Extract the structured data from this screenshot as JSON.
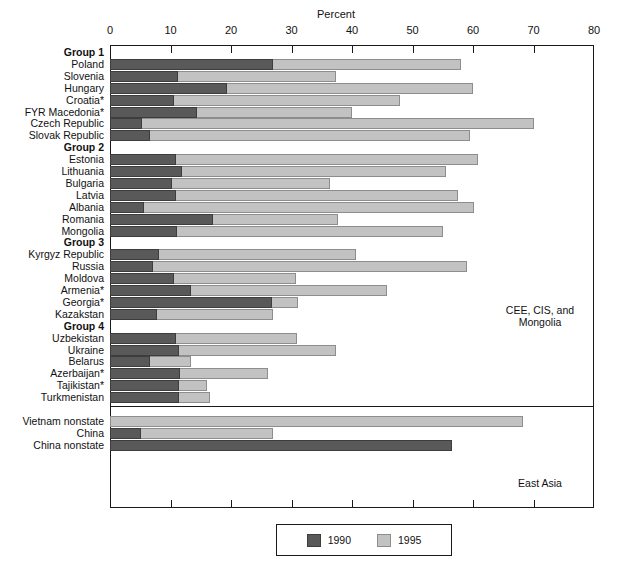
{
  "chart_data": {
    "type": "bar",
    "orientation": "horizontal",
    "stacked": false,
    "title": "",
    "xlabel": "Percent",
    "ylabel": "",
    "xlim": [
      0,
      80
    ],
    "xticks": [
      0,
      10,
      20,
      30,
      40,
      50,
      60,
      70,
      80
    ],
    "grid": false,
    "legend_position": "bottom",
    "series": [
      {
        "name": "1990",
        "color": "#595959"
      },
      {
        "name": "1995",
        "color": "#c2c2c2"
      }
    ],
    "annotations": [
      {
        "text": "CEE, CIS, and Mongolia",
        "region": "upper-right-inside-plot"
      },
      {
        "text": "East Asia",
        "region": "lower-right-inside-plot"
      }
    ],
    "rows": [
      {
        "label": "Group 1",
        "kind": "group",
        "v1990": null,
        "v1995": null
      },
      {
        "label": "Poland",
        "kind": "country",
        "v1990": 27.0,
        "v1995": 58.0
      },
      {
        "label": "Slovenia",
        "kind": "country",
        "v1990": 11.2,
        "v1995": 37.4
      },
      {
        "label": "Hungary",
        "kind": "country",
        "v1990": 19.3,
        "v1995": 60.0
      },
      {
        "label": "Croatia*",
        "kind": "country",
        "v1990": 10.6,
        "v1995": 48.0
      },
      {
        "label": "FYR Macedonia*",
        "kind": "country",
        "v1990": 14.4,
        "v1995": 40.0
      },
      {
        "label": "Czech Republic",
        "kind": "country",
        "v1990": 5.3,
        "v1995": 70.0
      },
      {
        "label": "Slovak Republic",
        "kind": "country",
        "v1990": 6.6,
        "v1995": 59.5
      },
      {
        "label": "Group 2",
        "kind": "group",
        "v1990": null,
        "v1995": null
      },
      {
        "label": "Estonia",
        "kind": "country",
        "v1990": 10.9,
        "v1995": 60.8
      },
      {
        "label": "Lithuania",
        "kind": "country",
        "v1990": 11.9,
        "v1995": 55.5
      },
      {
        "label": "Bulgaria",
        "kind": "country",
        "v1990": 10.2,
        "v1995": 36.4
      },
      {
        "label": "Latvia",
        "kind": "country",
        "v1990": 10.9,
        "v1995": 57.5
      },
      {
        "label": "Albania",
        "kind": "country",
        "v1990": 5.6,
        "v1995": 60.2
      },
      {
        "label": "Romania",
        "kind": "country",
        "v1990": 17.0,
        "v1995": 37.7
      },
      {
        "label": "Mongolia",
        "kind": "country",
        "v1990": 11.0,
        "v1995": 55.0
      },
      {
        "label": "Group 3",
        "kind": "group",
        "v1990": null,
        "v1995": null
      },
      {
        "label": "Kyrgyz Republic",
        "kind": "country",
        "v1990": 8.1,
        "v1995": 40.6
      },
      {
        "label": "Russia",
        "kind": "country",
        "v1990": 7.1,
        "v1995": 59.0
      },
      {
        "label": "Moldova",
        "kind": "country",
        "v1990": 10.6,
        "v1995": 30.8
      },
      {
        "label": "Armenia*",
        "kind": "country",
        "v1990": 13.4,
        "v1995": 45.8
      },
      {
        "label": "Georgia*",
        "kind": "country",
        "v1990": 26.8,
        "v1995": 31.0
      },
      {
        "label": "Kazakstan",
        "kind": "country",
        "v1990": 7.7,
        "v1995": 27.0
      },
      {
        "label": "Group 4",
        "kind": "group",
        "v1990": null,
        "v1995": null
      },
      {
        "label": "Uzbekistan",
        "kind": "country",
        "v1990": 10.9,
        "v1995": 30.9
      },
      {
        "label": "Ukraine",
        "kind": "country",
        "v1990": 11.4,
        "v1995": 37.4
      },
      {
        "label": "Belarus",
        "kind": "country",
        "v1990": 6.6,
        "v1995": 13.4
      },
      {
        "label": "Azerbaijan*",
        "kind": "country",
        "v1990": 11.6,
        "v1995": 26.1
      },
      {
        "label": "Tajikistan*",
        "kind": "country",
        "v1990": 11.4,
        "v1995": 16.0
      },
      {
        "label": "Turkmenistan",
        "kind": "country",
        "v1990": 11.4,
        "v1995": 16.5
      },
      {
        "label": "",
        "kind": "spacer",
        "v1990": null,
        "v1995": null
      },
      {
        "label": "Vietnam nonstate",
        "kind": "country",
        "v1990": null,
        "v1995": 68.3
      },
      {
        "label": "China",
        "kind": "country",
        "v1990": 5.1,
        "v1995": 27.0
      },
      {
        "label": "China nonstate",
        "kind": "country",
        "v1990": 56.5,
        "v1995": null
      }
    ]
  },
  "axis": {
    "title": "Percent",
    "ticks": [
      "0",
      "10",
      "20",
      "30",
      "40",
      "50",
      "60",
      "70",
      "80"
    ]
  },
  "legend": {
    "items": [
      {
        "label": "1990",
        "color": "#595959"
      },
      {
        "label": "1995",
        "color": "#c2c2c2"
      }
    ]
  },
  "notes": {
    "region_top": "CEE, CIS, and",
    "region_top_line2": "Mongolia",
    "region_bottom": "East Asia"
  }
}
